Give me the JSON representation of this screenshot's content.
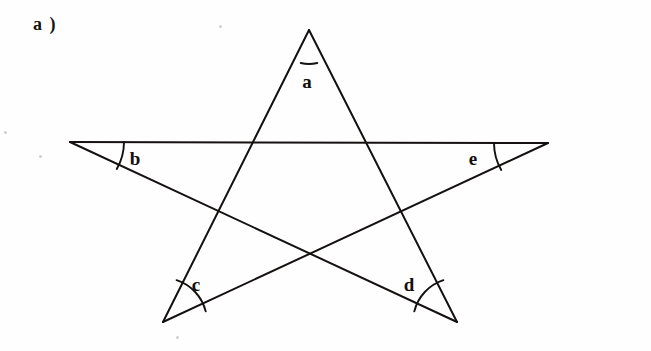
{
  "figure": {
    "label": "a )",
    "shape_name": "pentagram",
    "background_color": "#fefefe",
    "stroke_color": "#141110",
    "stroke_width": 2.0
  },
  "vertices": [
    {
      "name": "top-apex",
      "id": "A",
      "x": 309,
      "y": 30
    },
    {
      "name": "left-point",
      "id": "B",
      "x": 70,
      "y": 142
    },
    {
      "name": "right-point",
      "id": "E",
      "x": 548,
      "y": 143
    },
    {
      "name": "bottom-left",
      "id": "C",
      "x": 163,
      "y": 322
    },
    {
      "name": "bottom-right",
      "id": "D",
      "x": 457,
      "y": 322
    }
  ],
  "edges": [
    {
      "name": "apex-to-bottom-left",
      "from": "A",
      "to": "C"
    },
    {
      "name": "apex-to-bottom-right",
      "from": "A",
      "to": "D"
    },
    {
      "name": "left-to-right",
      "from": "B",
      "to": "E"
    },
    {
      "name": "left-to-bottom-right",
      "from": "B",
      "to": "D"
    },
    {
      "name": "right-to-bottom-left",
      "from": "E",
      "to": "C"
    }
  ],
  "angles": [
    {
      "name": "angle-a",
      "label": "a",
      "vertex": "A",
      "label_x": 307,
      "label_y": 81,
      "arc": {
        "cx": 309,
        "cy": 30,
        "r": 34,
        "start_deg": 76,
        "end_deg": 104
      }
    },
    {
      "name": "angle-b",
      "label": "b",
      "vertex": "B",
      "label_x": 135,
      "label_y": 158,
      "arc": {
        "cx": 70,
        "cy": 142,
        "r": 54,
        "start_deg": 0,
        "end_deg": 30
      }
    },
    {
      "name": "angle-c",
      "label": "c",
      "vertex": "C",
      "label_x": 196,
      "label_y": 284,
      "arc": {
        "cx": 163,
        "cy": 322,
        "r": 44,
        "start_deg": -72,
        "end_deg": -14
      }
    },
    {
      "name": "angle-d",
      "label": "d",
      "vertex": "D",
      "label_x": 409,
      "label_y": 284,
      "arc": {
        "cx": 457,
        "cy": 322,
        "r": 44,
        "start_deg": -166,
        "end_deg": -108
      }
    },
    {
      "name": "angle-e",
      "label": "e",
      "vertex": "E",
      "label_x": 473,
      "label_y": 158,
      "arc": {
        "cx": 548,
        "cy": 143,
        "r": 54,
        "start_deg": 150,
        "end_deg": 180
      }
    }
  ],
  "speckles": [
    {
      "x": 219,
      "y": 25,
      "d": 3
    },
    {
      "x": 4,
      "y": 131,
      "d": 3
    },
    {
      "x": 39,
      "y": 155,
      "d": 3
    },
    {
      "x": 176,
      "y": 336,
      "d": 3
    }
  ]
}
